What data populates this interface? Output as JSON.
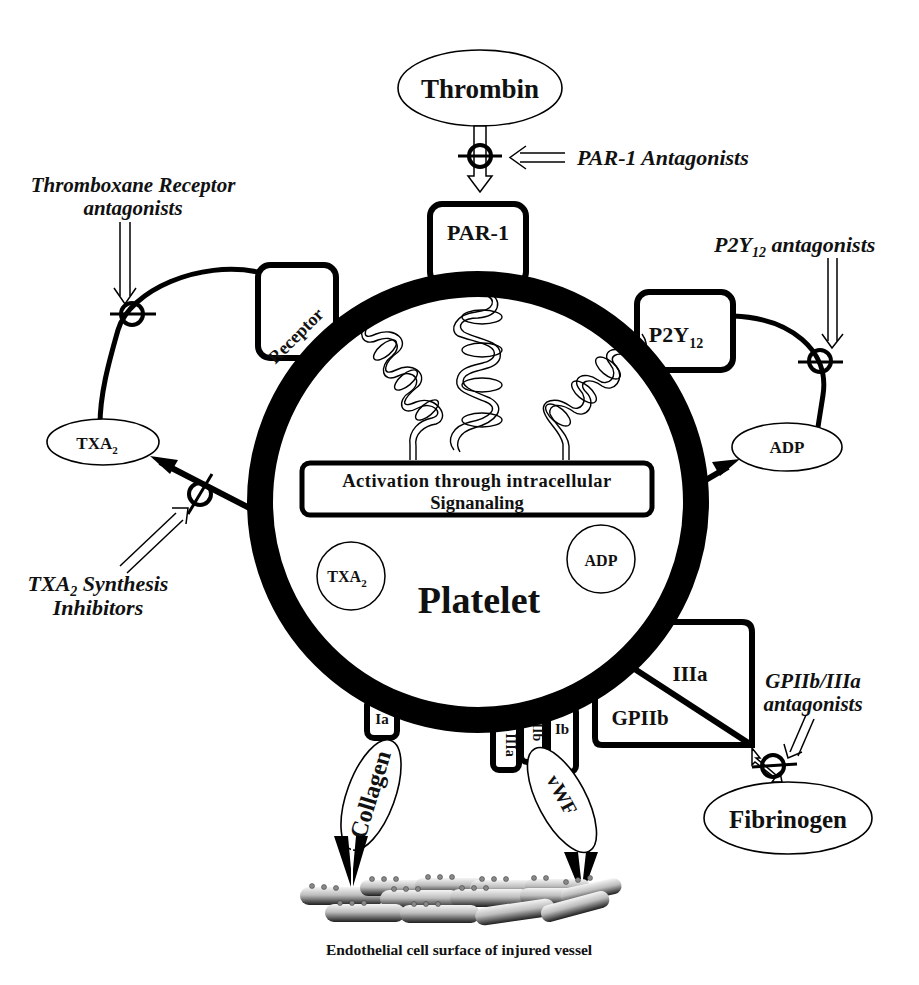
{
  "diagram": {
    "center_label": "Platelet",
    "signaling_box": {
      "line1": "Activation through intracellular",
      "line2": "Signanaling"
    },
    "agonists": {
      "thrombin": "Thrombin",
      "fibrinogen": "Fibrinogen",
      "txa2_external": "TXA",
      "txa2_external_sub": "2",
      "adp_external": "ADP",
      "collagen": "Collagen",
      "vwf": "vWF"
    },
    "internal_mediators": {
      "txa2": "TXA",
      "txa2_sub": "2",
      "adp": "ADP"
    },
    "receptors": {
      "par1": "PAR-1",
      "tx_receptor": "Receptor",
      "p2y12": "P2Y",
      "p2y12_sub": "12",
      "gpiib": "GPIIb",
      "iiia": "IIIa",
      "ia": "Ia",
      "iiia_small": "IIIa",
      "iib_small": "IIb",
      "ib": "Ib"
    },
    "inhibitors": {
      "par1": "PAR-1 Antagonists",
      "tx_receptor_line1": "Thromboxane Receptor",
      "tx_receptor_line2": "antagonists",
      "p2y12_prefix": "P2Y",
      "p2y12_sub": "12",
      "p2y12_suffix": " antagonists",
      "txa2_synth_prefix": "TXA",
      "txa2_synth_sub": "2",
      "txa2_synth_suffix": " Synthesis",
      "txa2_synth_line2": "Inhibitors",
      "gp_line1": "GPIIb/IIIa",
      "gp_line2": "antagonists"
    },
    "surface_caption": "Endothelial cell surface of injured vessel",
    "colors": {
      "ink": "#000000",
      "background": "#ffffff",
      "cell_light": "#e6e6e6",
      "cell_dark": "#3a3a3a"
    }
  }
}
